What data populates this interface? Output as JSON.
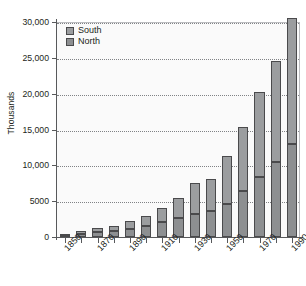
{
  "chart_data": {
    "type": "bar",
    "subtype": "stacked-bar",
    "title": "",
    "xlabel": "",
    "ylabel": "Thousands",
    "ylim": [
      0,
      30000
    ],
    "yticks": [
      0,
      5000,
      10000,
      15000,
      20000,
      25000,
      30000
    ],
    "ytick_labels": [
      "0",
      "5000",
      "10,000",
      "15,000",
      "20,000",
      "25,000",
      "30,000"
    ],
    "grid": true,
    "grid_style": "dotted-horizontal",
    "legend_position": "top-left-inside",
    "categories": [
      "1850",
      "1860",
      "1870",
      "1880",
      "1890",
      "1900",
      "1910",
      "1920",
      "1930",
      "1940",
      "1950",
      "1960",
      "1970",
      "1980",
      "1990"
    ],
    "xtick_labels_shown": [
      "1850",
      "1870",
      "1890",
      "1910",
      "1930",
      "1950",
      "1970",
      "1990"
    ],
    "series": [
      {
        "name": "North",
        "color": "#8d8f91",
        "values": [
          200,
          450,
          700,
          900,
          1100,
          1500,
          2100,
          2600,
          3200,
          3600,
          4600,
          6400,
          8400,
          10400,
          13000
        ]
      },
      {
        "name": "South",
        "color": "#9b9d9f",
        "values": [
          200,
          350,
          500,
          700,
          1100,
          1400,
          1900,
          2800,
          4300,
          4500,
          6700,
          8900,
          11900,
          14200,
          17500
        ]
      }
    ],
    "totals": [
      400,
      800,
      1200,
      1600,
      2200,
      2900,
      4000,
      5400,
      7500,
      8100,
      11300,
      15300,
      20300,
      24600,
      30500
    ]
  },
  "legend": {
    "items": [
      {
        "label": "South",
        "color": "#9b9d9f"
      },
      {
        "label": "North",
        "color": "#8d8f91"
      }
    ]
  },
  "axes": {
    "y_title": "Thousands"
  }
}
